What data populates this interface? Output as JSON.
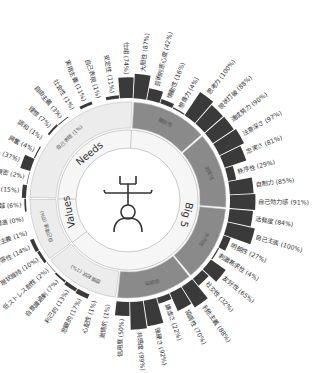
{
  "chart_data": {
    "type": "sunburst",
    "title": "",
    "center_icon": "person-figure-icon",
    "categories": [
      {
        "name": "Big 5",
        "children": [
          {
            "name": "開放性",
            "value": "",
            "traits": [
              {
                "label": "大胆性",
                "value": 87
              },
              {
                "label": "芸術的感心度",
                "value": 42
              },
              {
                "label": "情動性",
                "value": 16
              },
              {
                "label": "想像力",
                "value": 4
              },
              {
                "label": "思考力",
                "value": 100
              },
              {
                "label": "現状打破",
                "value": 88
              }
            ]
          },
          {
            "name": "誠実性",
            "value": "",
            "traits": [
              {
                "label": "達成努力",
                "value": 90
              },
              {
                "label": "注意深さ",
                "value": 97
              },
              {
                "label": "忠実さ",
                "value": 81
              },
              {
                "label": "秩序性",
                "value": 29
              },
              {
                "label": "自制力",
                "value": 85
              },
              {
                "label": "自己効力感",
                "value": 91
              }
            ]
          },
          {
            "name": "外向性",
            "value": "",
            "traits": [
              {
                "label": "活発度",
                "value": 84
              },
              {
                "label": "自己主張",
                "value": 100
              },
              {
                "label": "明朗性",
                "value": 27
              },
              {
                "label": "刺激希求性",
                "value": 4
              },
              {
                "label": "友好性",
                "value": 65
              },
              {
                "label": "社交性",
                "value": 32
              }
            ]
          },
          {
            "name": "協調性",
            "value": "",
            "traits": [
              {
                "label": "利他主義",
                "value": 88
              },
              {
                "label": "協調性",
                "value": 70
              },
              {
                "label": "謙虚さ",
                "value": 22
              },
              {
                "label": "強硬さ",
                "value": 92
              },
              {
                "label": "共感度",
                "value": 99
              },
              {
                "label": "信用度",
                "value": 50
              }
            ]
          },
          {
            "name": "感情起伏",
            "value": "1%",
            "traits": [
              {
                "label": "激情的",
                "value": 1
              },
              {
                "label": "心配性",
                "value": 1
              },
              {
                "label": "悲観的",
                "value": 17
              },
              {
                "label": "利己的",
                "value": 13
              },
              {
                "label": "自意識過剰",
                "value": 7
              },
              {
                "label": "低ストレス耐性",
                "value": 2
              }
            ]
          }
        ]
      },
      {
        "name": "Values",
        "children": [
          {
            "name": "自己増進",
            "value": "0%",
            "traits": [
              {
                "label": "現状維持",
                "value": 10
              },
              {
                "label": "変化許容性",
                "value": 14
              },
              {
                "label": "快楽主義",
                "value": 1
              },
              {
                "label": "自己増進",
                "value": 0
              },
              {
                "label": "自己超越",
                "value": 6
              }
            ]
          }
        ]
      },
      {
        "name": "Needs",
        "children": [
          {
            "name": "自己表現",
            "value": "1%",
            "traits": [
              {
                "label": "挑戦",
                "value": 15
              },
              {
                "label": "親密",
                "value": 2
              },
              {
                "label": "好奇心",
                "value": 37
              },
              {
                "label": "興奮",
                "value": 4
              },
              {
                "label": "調和",
                "value": 1
              },
              {
                "label": "理想",
                "value": 7
              },
              {
                "label": "自由主義",
                "value": 3
              },
              {
                "label": "社会性",
                "value": 1
              },
              {
                "label": "実用主義",
                "value": 11
              },
              {
                "label": "自己表現",
                "value": 1
              },
              {
                "label": "安定性",
                "value": 11
              },
              {
                "label": "仕組",
                "value": 74
              }
            ]
          }
        ]
      }
    ],
    "colors": {
      "bar": "#3a3a3a",
      "big5_segment": "#8a8a8a",
      "light_segment": "#ececec",
      "ring_border": "#bdbdbd",
      "inner_fill": "#f6f6f6"
    }
  },
  "ring_labels": {
    "needs": "Needs",
    "values": "Values",
    "big5": "Big 5"
  }
}
